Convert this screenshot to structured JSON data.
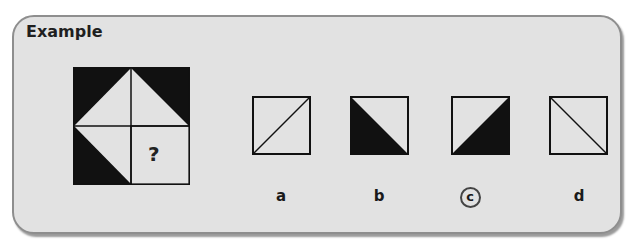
{
  "panel": {
    "title": "Example",
    "puzzle": {
      "description": "2x2 grid square; quadrants contain black corner triangles forming a diamond pattern; bottom-right quadrant missing",
      "missing_marker": "?"
    },
    "options": [
      {
        "label": "a",
        "shape": "empty square with diagonal from bottom-left to top-right",
        "selected": false
      },
      {
        "label": "b",
        "shape": "square with bottom-left black triangle (diagonal top-left to bottom-right)",
        "selected": false
      },
      {
        "label": "c",
        "shape": "square with bottom-right black triangle (diagonal bottom-left to top-right)",
        "selected": true
      },
      {
        "label": "d",
        "shape": "empty square with diagonal from top-left to bottom-right",
        "selected": false
      }
    ]
  },
  "colors": {
    "panel_bg": "#e2e2e2",
    "border": "#8e8e8e",
    "fill_dark": "#111111",
    "fill_light": "#e2e2e2",
    "answer_ring": "#444444"
  }
}
